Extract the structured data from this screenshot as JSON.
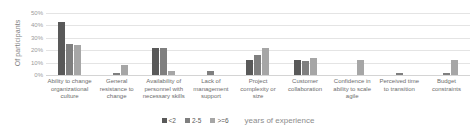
{
  "chart_data": {
    "type": "bar",
    "title": "",
    "xlabel": "years of experience",
    "ylabel": "Of participants",
    "ylim": [
      0,
      50
    ],
    "yunit": "%",
    "grid": true,
    "legend_position": "bottom",
    "yticks": [
      "0%",
      "10%",
      "20%",
      "30%",
      "40%",
      "50%"
    ],
    "ytick_values": [
      0,
      10,
      20,
      30,
      40,
      50
    ],
    "categories": [
      "Ability to change organizational culture",
      "General resistance to change",
      "Availability of personnel with necessary skills",
      "Lack of management support",
      "Project complexity or size",
      "Customer collaboration",
      "Confidence in ability to scale agile",
      "Perceived time to transition",
      "Budget constraints"
    ],
    "series": [
      {
        "name": "<2",
        "color": "#595959",
        "values": [
          43,
          0,
          22,
          0,
          12,
          12,
          0,
          0,
          0
        ]
      },
      {
        "name": "2-5",
        "color": "#7f7f7f",
        "values": [
          25,
          2,
          22,
          3,
          16,
          11,
          0,
          2,
          2
        ]
      },
      {
        "name": ">=6",
        "color": "#a6a6a6",
        "values": [
          24,
          8,
          3,
          0,
          22,
          14,
          12,
          0,
          12
        ]
      }
    ],
    "legend_caption": "years of experience"
  }
}
